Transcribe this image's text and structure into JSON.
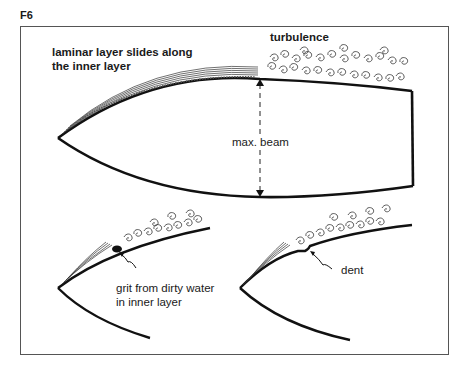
{
  "figure": {
    "label": "F6"
  },
  "main_hull": {
    "laminar_label_line1": "laminar layer slides along",
    "laminar_label_line2": "the inner layer",
    "turbulence_label": "turbulence",
    "beam_label": "max. beam"
  },
  "detail_grit": {
    "label_line1": "grit from dirty water",
    "label_line2": "in inner layer"
  },
  "detail_dent": {
    "label": "dent"
  },
  "colors": {
    "ink": "#1a1a1a",
    "frame": "#555555",
    "background": "#ffffff"
  }
}
